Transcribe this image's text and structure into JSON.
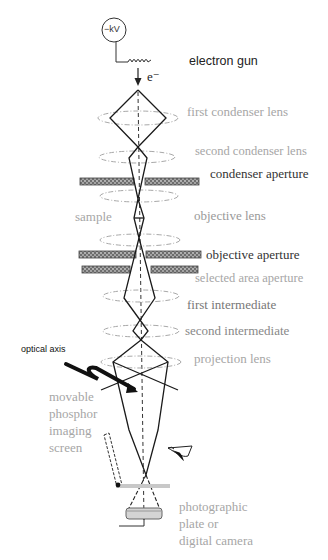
{
  "diagram": {
    "type": "TEM electron optics ray diagram",
    "colors": {
      "background": "#ffffff",
      "ray": "#1a1a1a",
      "axis": "#333333",
      "lens_ellipse": "#a8a8a8",
      "aperture_fill": "#7a7a7a",
      "screen": "#c8c8c8",
      "label_dark": "#222222",
      "label_mid": "#777777",
      "label_light": "#a6a6a6"
    },
    "source": {
      "voltage_label": "−kV",
      "electron_label": "e⁻"
    },
    "labels": {
      "electron_gun": "electron gun",
      "first_condenser_lens": "first condenser lens",
      "second_condenser_lens": "second condenser lens",
      "condenser_aperture": "condenser aperture",
      "sample": "sample",
      "objective_lens": "objective lens",
      "objective_aperture": "objective aperture",
      "selected_area_aperture": "selected area aperture",
      "first_intermediate": "first intermediate",
      "second_intermediate": "second intermediate",
      "optical_axis": "optical axis",
      "projection_lens": "projection lens",
      "phosphor_screen": "movable\nphosphor\nimaging\nscreen",
      "camera": "photographic\nplate or\ndigital camera"
    }
  }
}
